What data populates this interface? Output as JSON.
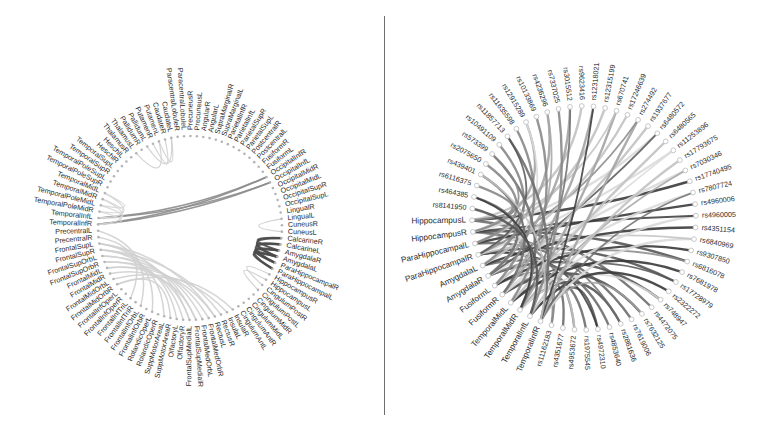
{
  "chart_data": [
    {
      "type": "chord",
      "title": "",
      "panel": "left",
      "center": [
        190,
        228
      ],
      "radius": 92,
      "label_font_size": 7.2,
      "node_color": "#b5b5b5",
      "nodes": [
        "PrecentralL",
        "PrecentralR",
        "FrontalSupL",
        "FrontalSupR",
        "FrontalSupOrbL",
        "FrontalSupOrbR",
        "FrontalMidL",
        "FrontalMidR",
        "FrontalMidOrbL",
        "FrontalMidOrbR",
        "FrontalInfOperL",
        "FrontalInfOperR",
        "FrontalInfTriL",
        "FrontalInfTriR",
        "FrontalInfOrbL",
        "FrontalInfOrbR",
        "RolandicOperL",
        "RolandicOperR",
        "SuppMotorAreaL",
        "SuppMotorAreaR",
        "OlfactoryL",
        "OlfactoryR",
        "FrontalSupMedialL",
        "FrontalSupMedialR",
        "FrontalMedOrbL",
        "FrontalMedOrbR",
        "RectusL",
        "RectusR",
        "InsulaL",
        "InsulaR",
        "CingulumAntL",
        "CingulumAntR",
        "CingulumMidL",
        "CingulumMidR",
        "CingulumPostL",
        "CingulumPostR",
        "HippocampusL",
        "HippocampusR",
        "ParaHippocampalL",
        "ParaHippocampalR",
        "AmygdalaL",
        "AmygdalaR",
        "CalcarineL",
        "CalcarineR",
        "CuneusL",
        "CuneusR",
        "LingualL",
        "LingualR",
        "OccipitalSupL",
        "OccipitalSupR",
        "OccipitalMidL",
        "OccipitalMidR",
        "OccipitalInfL",
        "OccipitalInfR",
        "FusiformL",
        "FusiformR",
        "PostcentralL",
        "PostcentralR",
        "ParietalSupL",
        "ParietalSupR",
        "ParietalInfL",
        "ParietalInfR",
        "SupraMarginalL",
        "SupraMarginalR",
        "AngularL",
        "AngularR",
        "PrecuneusL",
        "PrecuneusR",
        "ParacentralLobuleL",
        "ParacentralLobuleR",
        "CaudateL",
        "CaudateR",
        "PutamenL",
        "PutamenR",
        "PallidumL",
        "PallidumR",
        "ThalamusL",
        "ThalamusR",
        "HeschlL",
        "HeschlR",
        "TemporalSupL",
        "TemporalSupR",
        "TemporalPoleSupL",
        "TemporalPoleSupR",
        "TemporalMidL",
        "TemporalMidR",
        "TemporalPoleMidL",
        "TemporalPoleMidR",
        "TemporalInfL",
        "TemporalInfR"
      ],
      "edge_groups": [
        {
          "color": "#8c8c8c",
          "width": 1.6,
          "edges": [
            [
              89,
              52
            ],
            [
              88,
              53
            ],
            [
              89,
              53
            ],
            [
              88,
              52
            ]
          ]
        },
        {
          "color": "#4a4a4a",
          "width": 2.2,
          "edges": [
            [
              39,
              41
            ],
            [
              39,
              40
            ],
            [
              38,
              41
            ],
            [
              40,
              42
            ],
            [
              41,
              43
            ],
            [
              38,
              40
            ],
            [
              39,
              42
            ],
            [
              40,
              43
            ]
          ]
        },
        {
          "color": "#d0d0d0",
          "width": 1.5,
          "edges": [
            [
              2,
              22
            ],
            [
              3,
              23
            ],
            [
              4,
              24
            ],
            [
              5,
              25
            ],
            [
              6,
              26
            ],
            [
              2,
              26
            ],
            [
              3,
              27
            ],
            [
              5,
              21
            ],
            [
              4,
              20
            ],
            [
              8,
              28
            ],
            [
              9,
              29
            ],
            [
              6,
              22
            ],
            [
              7,
              23
            ],
            [
              1,
              12
            ],
            [
              0,
              14
            ],
            [
              2,
              16
            ],
            [
              3,
              18
            ],
            [
              9,
              19
            ]
          ]
        },
        {
          "color": "#d6d6d6",
          "width": 1.2,
          "edges": [
            [
              84,
              88
            ],
            [
              85,
              89
            ],
            [
              86,
              88
            ],
            [
              87,
              89
            ],
            [
              84,
              86
            ],
            [
              85,
              87
            ]
          ]
        },
        {
          "color": "#cfcfcf",
          "width": 1.2,
          "edges": [
            [
              70,
              72
            ],
            [
              71,
              73
            ],
            [
              70,
              74
            ],
            [
              72,
              76
            ],
            [
              34,
              36
            ],
            [
              35,
              37
            ],
            [
              44,
              46
            ]
          ]
        }
      ]
    },
    {
      "type": "chord",
      "title": "",
      "panel": "right",
      "center": [
        198,
        218
      ],
      "radius": 112,
      "label_font_size": 7.2,
      "node_color": "#c8c8c8",
      "brain_regions": [
        "HippocampusL",
        "HippocampusR",
        "ParaHippocampalL",
        "ParaHippocampalR",
        "AmygdalaL",
        "AmygdalaR",
        "FusiformL",
        "FusiformR",
        "TemporalMidL",
        "TemporalMidR",
        "TemporalInfL",
        "TemporalInfR"
      ],
      "snps": [
        "rs11162183",
        "rs4351677",
        "rs4953672",
        "rs1975545",
        "rs4972310",
        "rs4853640",
        "rs2861636",
        "rs7619006",
        "rs7632125",
        "rs4472075",
        "rs748947",
        "rs2322272",
        "rs17728979",
        "rs7681978",
        "rs6816078",
        "rs9307850",
        "rs6840969",
        "rs4351154",
        "rs4960005",
        "rs4960006",
        "rs7807724",
        "rs17740495",
        "rs7030346",
        "rs17793675",
        "rs11253896",
        "rs6480565",
        "rs6480572",
        "rs1937677",
        "rs274492",
        "rs17246639",
        "rs670741",
        "rs12315199",
        "rs12318021",
        "rs9623416",
        "rs3015512",
        "rs7337025",
        "rs4236296",
        "rs10133869",
        "rs12915289",
        "rs11635598",
        "rs11857713",
        "rs10491109",
        "rs573399",
        "rs2075650",
        "rs439401",
        "rs6116375",
        "rs464385",
        "rs8141950"
      ],
      "edge_colors": [
        "#3a3a3a",
        "#555555",
        "#6e6e6e",
        "#888888",
        "#a4a4a4",
        "#c2c2c2",
        "#dadada"
      ]
    }
  ],
  "layout": {
    "divider_color": "#6e6e6e"
  }
}
